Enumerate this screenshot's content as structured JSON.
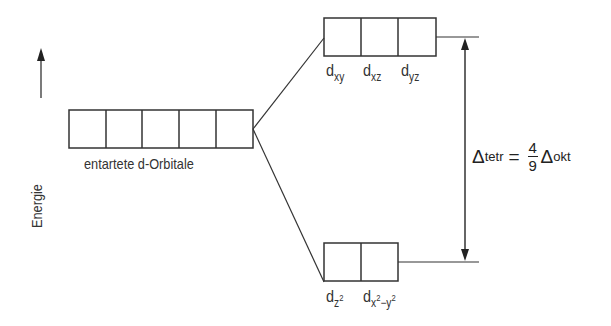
{
  "axis": {
    "label": "Energie"
  },
  "degenerate": {
    "label": "entartete d-Orbitale",
    "count": 5
  },
  "upper_set": {
    "count": 3,
    "orbitals": [
      {
        "base": "d",
        "sub": "xy"
      },
      {
        "base": "d",
        "sub": "xz"
      },
      {
        "base": "d",
        "sub": "yz"
      }
    ]
  },
  "lower_set": {
    "count": 2,
    "orbitals": [
      {
        "base": "d",
        "sub": "z",
        "sup": "2"
      },
      {
        "base": "d",
        "sub_parts": [
          "x",
          "2",
          "−y",
          "2"
        ]
      }
    ]
  },
  "splitting": {
    "delta": "Δ",
    "lhs_sub": "tetr",
    "equals": "=",
    "numerator": "4",
    "denominator": "9",
    "rhs_sub": "okt"
  },
  "colors": {
    "line": "#333333",
    "text": "#222222",
    "background": "#ffffff"
  }
}
